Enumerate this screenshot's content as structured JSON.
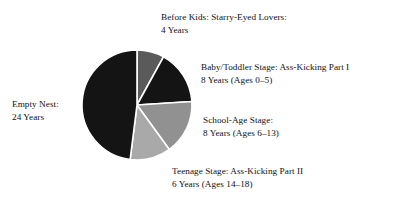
{
  "chart_data": {
    "type": "pie",
    "title": "",
    "subtitle": "",
    "xlabel": "",
    "ylabel": "",
    "legend_position": "labels-around-pie",
    "grid": false,
    "total_years": 50,
    "units": "Years",
    "start_angle_deg": 0,
    "direction": "clockwise",
    "categories": [
      "Before Kids: Starry-Eyed Lovers",
      "Baby/Toddler Stage: Ass-Kicking Part I",
      "School-Age Stage",
      "Teenage Stage: Ass-Kicking Part II",
      "Empty Nest"
    ],
    "values": [
      4,
      8,
      8,
      6,
      24
    ],
    "slices": [
      {
        "name": "before-kids",
        "label_line1": "Before Kids: Starry-Eyed Lovers:",
        "label_line2": "4 Years",
        "value": 4,
        "percent": 8,
        "angle_deg": 28.8,
        "color": "#5a5a5a"
      },
      {
        "name": "baby-toddler",
        "label_line1": "Baby/Toddler Stage: Ass-Kicking Part I",
        "label_line2": "8 Years (Ages 0–5)",
        "value": 8,
        "percent": 16,
        "angle_deg": 57.6,
        "color": "#141414"
      },
      {
        "name": "school-age",
        "label_line1": "School-Age Stage:",
        "label_line2": "8 Years (Ages 6–13)",
        "value": 8,
        "percent": 16,
        "angle_deg": 57.6,
        "color": "#919191"
      },
      {
        "name": "teenage",
        "label_line1": "Teenage Stage: Ass-Kicking Part II",
        "label_line2": "6 Years (Ages 14–18)",
        "value": 6,
        "percent": 12,
        "angle_deg": 43.2,
        "color": "#a9a9a9"
      },
      {
        "name": "empty-nest",
        "label_line1": "Empty Nest:",
        "label_line2": "24 Years",
        "value": 24,
        "percent": 48,
        "angle_deg": 172.8,
        "color": "#141414"
      }
    ],
    "separator_color": "#ffffff",
    "background_color": "#ffffff"
  }
}
